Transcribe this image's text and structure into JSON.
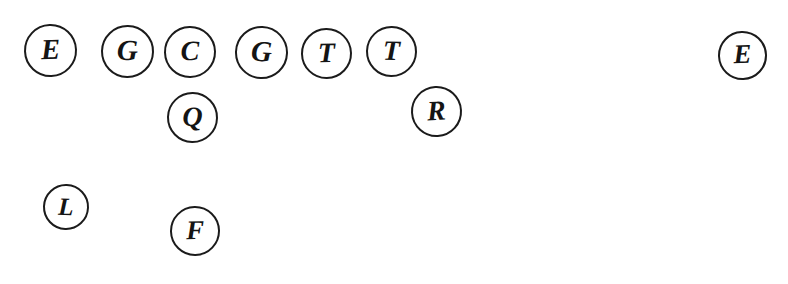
{
  "canvas": {
    "width": 788,
    "height": 284,
    "background_color": "#ffffff",
    "stroke_color": "#1b1b1b",
    "glyph_color": "#141414",
    "description": "Hand-drawn letter tokens: circled capital letters scattered on a white background"
  },
  "tokens": [
    {
      "id": "token-1",
      "letter": "E",
      "cx": 50,
      "cy": 50,
      "d": 53,
      "font_size": 29,
      "rotate": -2
    },
    {
      "id": "token-2",
      "letter": "G",
      "cx": 127,
      "cy": 51,
      "d": 53,
      "font_size": 29,
      "rotate": 1
    },
    {
      "id": "token-3",
      "letter": "C",
      "cx": 190,
      "cy": 52,
      "d": 52,
      "font_size": 28,
      "rotate": -1
    },
    {
      "id": "token-4",
      "letter": "G",
      "cx": 261,
      "cy": 52,
      "d": 53,
      "font_size": 29,
      "rotate": 2
    },
    {
      "id": "token-5",
      "letter": "T",
      "cx": 326,
      "cy": 53,
      "d": 51,
      "font_size": 28,
      "rotate": -1
    },
    {
      "id": "token-6",
      "letter": "T",
      "cx": 391,
      "cy": 51,
      "d": 51,
      "font_size": 28,
      "rotate": 1
    },
    {
      "id": "token-7",
      "letter": "E",
      "cx": 742,
      "cy": 55,
      "d": 49,
      "font_size": 27,
      "rotate": -2
    },
    {
      "id": "token-8",
      "letter": "Q",
      "cx": 192,
      "cy": 117,
      "d": 51,
      "font_size": 28,
      "rotate": 1
    },
    {
      "id": "token-9",
      "letter": "R",
      "cx": 436,
      "cy": 111,
      "d": 51,
      "font_size": 28,
      "rotate": -3
    },
    {
      "id": "token-10",
      "letter": "L",
      "cx": 66,
      "cy": 207,
      "d": 46,
      "font_size": 25,
      "rotate": 2
    },
    {
      "id": "token-11",
      "letter": "F",
      "cx": 195,
      "cy": 231,
      "d": 50,
      "font_size": 27,
      "rotate": -1
    }
  ],
  "letters_sequence": "E G C G T T E Q R L F"
}
